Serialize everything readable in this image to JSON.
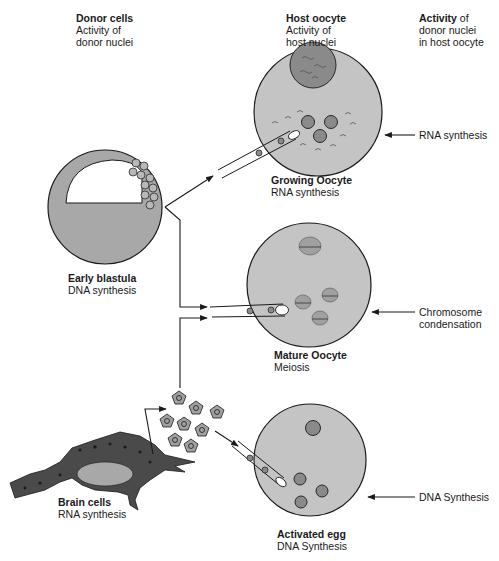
{
  "columns": {
    "donor": {
      "title": "Donor cells",
      "line1": "Activity of",
      "line2": "donor nuclei"
    },
    "host": {
      "title": "Host oocyte",
      "line1": "Activity of",
      "line2": "host nuclei"
    },
    "activity": {
      "title_bold": "Activity",
      "title_rest": " of",
      "line1": "donor nuclei",
      "line2": "in host oocyte"
    }
  },
  "donors": {
    "blastula": {
      "name": "Early blastula",
      "activity": "DNA synthesis"
    },
    "brain": {
      "name": "Brain cells",
      "activity": "RNA synthesis"
    }
  },
  "hosts": [
    {
      "name": "Growing Oocyte",
      "activity": "RNA synthesis",
      "result": [
        "RNA synthesis"
      ]
    },
    {
      "name": "Mature Oocyte",
      "activity": "Meiosis",
      "result": [
        "Chromosome",
        "condensation"
      ]
    },
    {
      "name": "Activated egg",
      "activity": "DNA Synthesis",
      "result": [
        "DNA Synthesis"
      ]
    }
  ],
  "colors": {
    "oocyte_fill": "#c4c4c4",
    "blastula_fill": "#a8a8a8",
    "nucleus_fill": "#8a8a8a",
    "line": "#1a1a1a"
  }
}
